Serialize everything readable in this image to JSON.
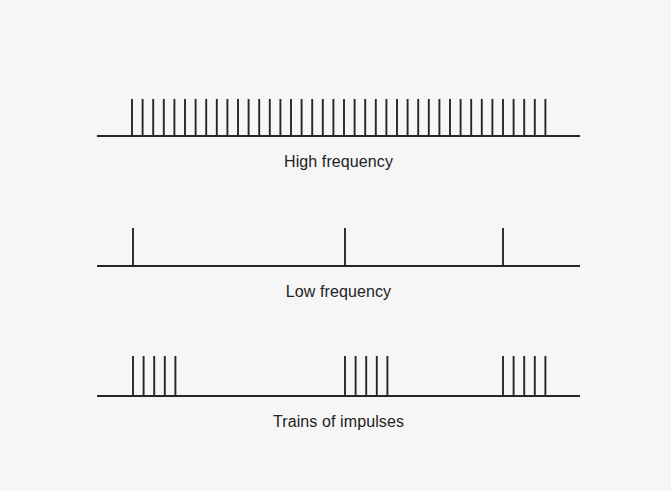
{
  "diagram": {
    "title": "",
    "line_color": "#262626",
    "background": "#f6f6f6",
    "panels": [
      {
        "id": "high",
        "label": "High frequency",
        "baseline_y": 136,
        "x_start": 97,
        "x_end": 580,
        "spike_top": 99,
        "spike_spacing": 10.6,
        "trains": [
          {
            "x": 132,
            "count": 40
          }
        ],
        "label_y": 153
      },
      {
        "id": "low",
        "label": "Low frequency",
        "baseline_y": 266,
        "x_start": 97,
        "x_end": 580,
        "spike_top": 228,
        "spike_spacing": 10.6,
        "trains": [
          {
            "x": 133,
            "count": 1
          },
          {
            "x": 345,
            "count": 1
          },
          {
            "x": 503,
            "count": 1
          }
        ],
        "label_y": 283
      },
      {
        "id": "trains",
        "label": "Trains of impulses",
        "baseline_y": 396,
        "x_start": 97,
        "x_end": 580,
        "spike_top": 356,
        "spike_spacing": 10.6,
        "trains": [
          {
            "x": 133,
            "count": 5
          },
          {
            "x": 345,
            "count": 5
          },
          {
            "x": 503,
            "count": 5
          }
        ],
        "label_y": 413
      }
    ]
  }
}
